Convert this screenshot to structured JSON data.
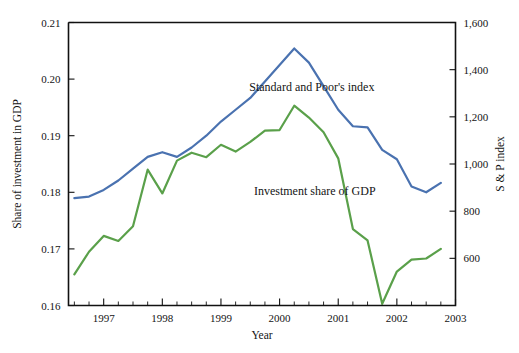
{
  "chart_data": {
    "type": "line",
    "title": "",
    "subtitle": "",
    "xlabel": "Year",
    "ylabel": "Share of investment in GDP",
    "y2label": "S & P index",
    "xlim": [
      1996.4,
      2003.0
    ],
    "ylim": [
      0.16,
      0.21
    ],
    "y2lim": [
      400,
      1600
    ],
    "grid": false,
    "legend_position": "inline-annotations",
    "xticks": [
      1997,
      1998,
      1999,
      2000,
      2001,
      2002,
      2003
    ],
    "xticklabels": [
      "1997",
      "1998",
      "1999",
      "2000",
      "2001",
      "2002",
      "2003"
    ],
    "yticks": [
      0.16,
      0.17,
      0.18,
      0.19,
      0.2,
      0.21
    ],
    "yticklabels": [
      "0.16",
      "0.17",
      "0.18",
      "0.19",
      "0.20",
      "0.21"
    ],
    "y2ticks": [
      600,
      800,
      1000,
      1200,
      1400,
      1600
    ],
    "y2ticklabels": [
      "600",
      "800",
      "1,000",
      "1,200",
      "1,400",
      "1,600"
    ],
    "annotations": [
      {
        "text": "Standard and Poor's index",
        "x": 2000.55,
        "y": 1310,
        "axis": "right"
      },
      {
        "text": "Investment share of GDP",
        "x": 2000.6,
        "y": 0.1795,
        "axis": "left"
      }
    ],
    "series": [
      {
        "name": "Standard and Poor's index",
        "color": "#4a72b0",
        "axis": "right",
        "x": [
          1996.5,
          1996.75,
          1997.0,
          1997.25,
          1997.5,
          1997.75,
          1998.0,
          1998.25,
          1998.5,
          1998.75,
          1999.0,
          1999.25,
          1999.5,
          1999.75,
          2000.0,
          2000.25,
          2000.5,
          2000.75,
          2001.0,
          2001.25,
          2001.5,
          2001.75,
          2002.0,
          2002.25,
          2002.5,
          2002.75
        ],
        "values": [
          855,
          862,
          890,
          930,
          980,
          1030,
          1050,
          1030,
          1070,
          1120,
          1180,
          1230,
          1280,
          1350,
          1420,
          1490,
          1430,
          1330,
          1230,
          1160,
          1155,
          1060,
          1020,
          905,
          880,
          920
        ]
      },
      {
        "name": "Investment share of GDP",
        "color": "#5aa04a",
        "axis": "left",
        "x": [
          1996.5,
          1996.75,
          1997.0,
          1997.25,
          1997.5,
          1997.75,
          1998.0,
          1998.25,
          1998.5,
          1998.75,
          1999.0,
          1999.25,
          1999.5,
          1999.75,
          2000.0,
          2000.25,
          2000.5,
          2000.75,
          2001.0,
          2001.25,
          2001.5,
          2001.75,
          2002.0,
          2002.25,
          2002.5,
          2002.75
        ],
        "values": [
          0.1655,
          0.1695,
          0.1723,
          0.1714,
          0.174,
          0.184,
          0.1798,
          0.1856,
          0.187,
          0.1862,
          0.1884,
          0.1872,
          0.1889,
          0.1909,
          0.191,
          0.1953,
          0.1932,
          0.1906,
          0.186,
          0.1735,
          0.1715,
          0.1603,
          0.166,
          0.1681,
          0.1683,
          0.17
        ]
      }
    ]
  },
  "axes": {
    "left_title": "Share of investment in GDP",
    "right_title": "S & P index",
    "bottom_title": "Year"
  }
}
